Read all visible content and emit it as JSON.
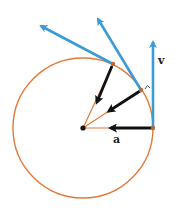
{
  "diagram": {
    "type": "uniform-circular-motion",
    "colors": {
      "circle": "#e07b39",
      "velocity": "#3a9bd5",
      "acceleration": "#111111",
      "center": "#111111"
    },
    "center": {
      "x": 83,
      "y": 128
    },
    "radius": 70,
    "labels": {
      "velocity": "v",
      "acceleration": "a",
      "right_angle_mark": "^"
    },
    "points": [
      {
        "name": "p1",
        "x": 153,
        "y": 128,
        "v_tip": {
          "x": 153,
          "y": 38
        },
        "a_tip": {
          "x": 107,
          "y": 128
        }
      },
      {
        "name": "p2",
        "x": 141,
        "y": 90,
        "v_tip": {
          "x": 96,
          "y": 15
        },
        "a_tip": {
          "x": 106,
          "y": 113
        }
      },
      {
        "name": "p3",
        "x": 113,
        "y": 64,
        "v_tip": {
          "x": 37,
          "y": 24
        },
        "a_tip": {
          "x": 95,
          "y": 106
        }
      }
    ]
  }
}
